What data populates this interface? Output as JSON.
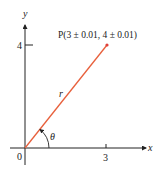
{
  "diagram": {
    "type": "polar-coordinate-point",
    "axes": {
      "x_label": "x",
      "y_label": "y",
      "origin_label": "0",
      "x_tick_label": "3",
      "y_tick_label": "4"
    },
    "point": {
      "label": "P(3 ± 0.01, 4 ± 0.01)",
      "x": 3,
      "y": 4,
      "x_error": 0.01,
      "y_error": 0.01
    },
    "segment_label": "r",
    "angle_label": "θ",
    "colors": {
      "segment": "#e8603c",
      "axes": "#222222",
      "point": "#e0403a"
    }
  }
}
